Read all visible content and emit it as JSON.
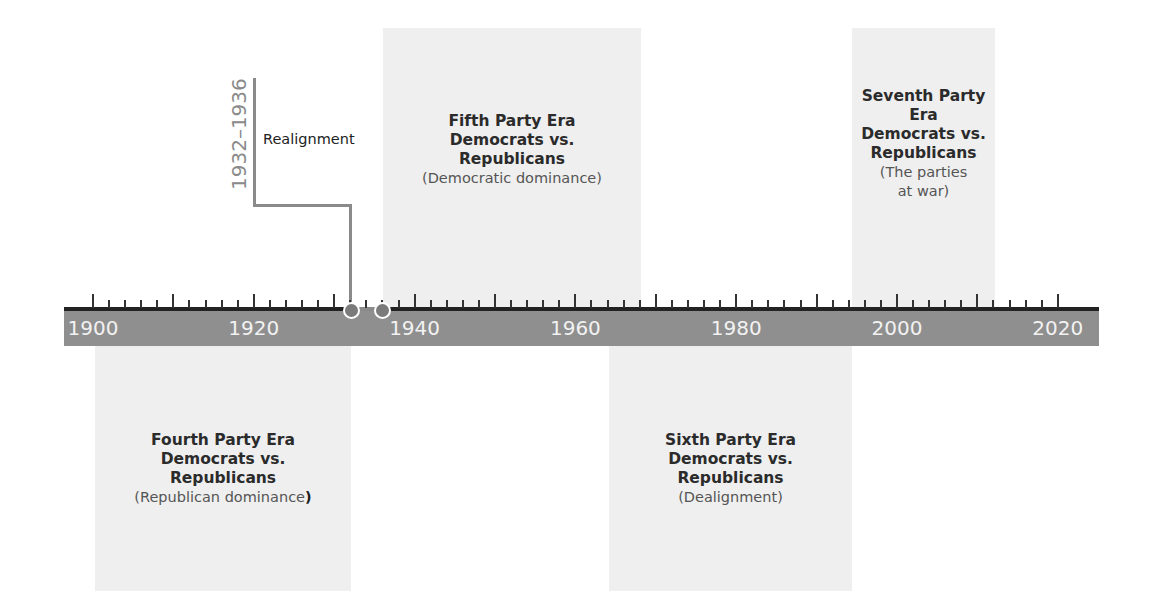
{
  "timeline": {
    "start_year": 1900,
    "end_year": 2020,
    "labels": [
      "1900",
      "1920",
      "1940",
      "1960",
      "1980",
      "2000",
      "2020"
    ],
    "minor_tick_interval_years": 2,
    "major_tick_interval_years": 10
  },
  "realignment": {
    "years": "1932–1936",
    "label": "Realignment",
    "markers": [
      1932,
      1936
    ]
  },
  "eras": [
    {
      "id": "fourth",
      "title": "Fourth Party Era\nDemocrats vs.\nRepublicans",
      "subtitle": "(Republican dominance",
      "subtitle_close": ")",
      "position": "below",
      "span": "1900–1932"
    },
    {
      "id": "fifth",
      "title": "Fifth Party Era\nDemocrats vs.\nRepublicans",
      "subtitle": "(Democratic dominance)",
      "position": "above",
      "span": "1936–1968"
    },
    {
      "id": "sixth",
      "title": "Sixth Party Era\nDemocrats vs.\nRepublicans",
      "subtitle": "(Dealignment)",
      "position": "below",
      "span": "1968–1998"
    },
    {
      "id": "seventh",
      "title": "Seventh Party\nEra\nDemocrats vs.\nRepublicans",
      "subtitle": "(The parties\nat war)",
      "position": "above",
      "span": "1998–2016"
    }
  ],
  "colors": {
    "box_fill": "#efefef",
    "axis_band": "#8f8f8f",
    "axis_line": "#222222",
    "marker": "#7b7b7b",
    "connector": "#8a8a8a"
  }
}
